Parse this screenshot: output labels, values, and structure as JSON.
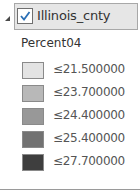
{
  "layer": {
    "name": "Illinois_cnty",
    "visible": true,
    "expanded": true,
    "field": "Percent04"
  },
  "legend": {
    "items": [
      {
        "label": "≤21.500000",
        "color": "#e3e3e3"
      },
      {
        "label": "≤23.700000",
        "color": "#b8b8b8"
      },
      {
        "label": "≤24.400000",
        "color": "#989898"
      },
      {
        "label": "≤25.400000",
        "color": "#727272"
      },
      {
        "label": "≤27.700000",
        "color": "#3e3e3e"
      }
    ]
  },
  "colors": {
    "check": "#2a6fb5",
    "selection_bg": "#e6e6e6"
  }
}
